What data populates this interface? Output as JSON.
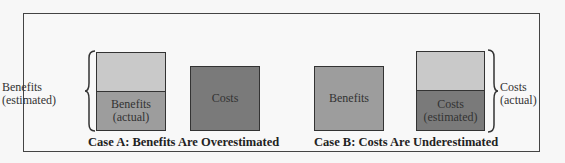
{
  "colors": {
    "light_gray": "#c9c9c9",
    "medium_gray": "#9d9d9d",
    "dark_gray": "#7a7a7a",
    "border": "#333333",
    "background": "#f7f7f7"
  },
  "case_a": {
    "caption": "Case A: Benefits Are Overestimated",
    "brace_label_line1": "Benefits",
    "brace_label_line2": "(estimated)",
    "benefits_box": {
      "top_segment_label": "",
      "bottom_segment_line1": "Benefits",
      "bottom_segment_line2": "(actual)"
    },
    "costs_box": {
      "label": "Costs"
    }
  },
  "case_b": {
    "caption": "Case B: Costs Are Underestimated",
    "brace_label_line1": "Costs",
    "brace_label_line2": "(actual)",
    "benefits_box": {
      "label": "Benefits"
    },
    "costs_box": {
      "top_segment_label": "",
      "bottom_segment_line1": "Costs",
      "bottom_segment_line2": "(estimated)"
    }
  }
}
